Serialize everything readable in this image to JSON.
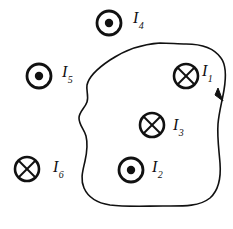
{
  "figure": {
    "background_color": "#ffffff",
    "stroke_color": "#111111",
    "width": 233,
    "height": 229
  },
  "loop": {
    "name": "amperian-loop",
    "description": "closed irregular contour",
    "direction_arrow": "clockwise",
    "arrow_label": ""
  },
  "currents": [
    {
      "id": "I1",
      "symbol_name": "current-into-page",
      "glyph": "cross-circle",
      "label_base": "I",
      "label_sub": "1",
      "inside_loop": true,
      "cx": 186,
      "cy": 76,
      "r": 12,
      "label_x": 202,
      "label_y": 63
    },
    {
      "id": "I2",
      "symbol_name": "current-out-of-page",
      "glyph": "dot-circle",
      "label_base": "I",
      "label_sub": "2",
      "inside_loop": true,
      "cx": 131,
      "cy": 170,
      "r": 12,
      "label_x": 152,
      "label_y": 159
    },
    {
      "id": "I3",
      "symbol_name": "current-into-page",
      "glyph": "cross-circle",
      "label_base": "I",
      "label_sub": "3",
      "inside_loop": true,
      "cx": 152,
      "cy": 125,
      "r": 12,
      "label_x": 173,
      "label_y": 117
    },
    {
      "id": "I4",
      "symbol_name": "current-out-of-page",
      "glyph": "dot-circle",
      "label_base": "I",
      "label_sub": "4",
      "inside_loop": false,
      "cx": 109,
      "cy": 23,
      "r": 12,
      "label_x": 133,
      "label_y": 10
    },
    {
      "id": "I5",
      "symbol_name": "current-out-of-page",
      "glyph": "dot-circle",
      "label_base": "I",
      "label_sub": "5",
      "inside_loop": false,
      "cx": 39,
      "cy": 76,
      "r": 12,
      "label_x": 62,
      "label_y": 64
    },
    {
      "id": "I6",
      "symbol_name": "current-into-page",
      "glyph": "cross-circle",
      "label_base": "I",
      "label_sub": "6",
      "inside_loop": false,
      "cx": 27,
      "cy": 169,
      "r": 12,
      "label_x": 53,
      "label_y": 159
    }
  ]
}
